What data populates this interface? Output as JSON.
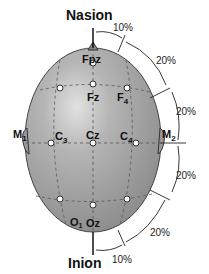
{
  "diagram": {
    "title_top": "Nasion",
    "title_bottom": "Inion",
    "electrodes": {
      "fpz": "Fpz",
      "fz": "Fz",
      "f4": "F",
      "f4_sub": "4",
      "c3": "C",
      "c3_sub": "3",
      "cz": "Cz",
      "c4": "C",
      "c4_sub": "4",
      "o1": "O",
      "o1_sub": "1",
      "oz": "Oz",
      "m1": "M",
      "m1_sub": "1",
      "m2": "M",
      "m2_sub": "2"
    },
    "percentages": {
      "top": "10%",
      "upper_right": "20%",
      "mid_upper": "20%",
      "mid_lower": "20%",
      "lower_right": "20%",
      "bottom": "10%"
    },
    "colors": {
      "head_fill": "#a9a9a9",
      "head_highlight": "#d6d6d6",
      "outline": "#333333",
      "text": "#111111"
    }
  }
}
